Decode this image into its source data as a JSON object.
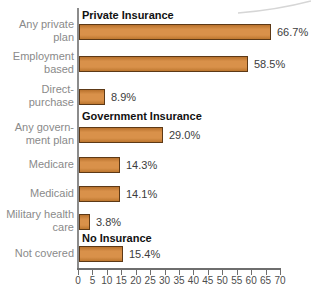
{
  "chart_data": {
    "type": "bar",
    "orientation": "horizontal",
    "title": "",
    "xlabel": "",
    "ylabel": "",
    "xlim": [
      0,
      70
    ],
    "x_ticks": [
      0,
      5,
      10,
      15,
      20,
      25,
      30,
      35,
      40,
      45,
      50,
      55,
      60,
      65,
      70
    ],
    "grid": false,
    "legend": false,
    "groups": [
      {
        "header": "Private Insurance",
        "items": [
          {
            "label": "Any private plan",
            "label_lines": [
              "Any private",
              "plan"
            ],
            "value": 66.7,
            "value_label": "66.7%"
          },
          {
            "label": "Employment based",
            "label_lines": [
              "Employment",
              "based"
            ],
            "value": 58.5,
            "value_label": "58.5%"
          },
          {
            "label": "Direct-purchase",
            "label_lines": [
              "Direct-",
              "purchase"
            ],
            "value": 8.9,
            "value_label": "8.9%"
          }
        ]
      },
      {
        "header": "Government Insurance",
        "items": [
          {
            "label": "Any government plan",
            "label_lines": [
              "Any govern-",
              "ment plan"
            ],
            "value": 29.0,
            "value_label": "29.0%"
          },
          {
            "label": "Medicare",
            "label_lines": [
              "Medicare"
            ],
            "value": 14.3,
            "value_label": "14.3%"
          },
          {
            "label": "Medicaid",
            "label_lines": [
              "Medicaid"
            ],
            "value": 14.1,
            "value_label": "14.1%"
          },
          {
            "label": "Military health care",
            "label_lines": [
              "Military health",
              "care"
            ],
            "value": 3.8,
            "value_label": "3.8%"
          }
        ]
      },
      {
        "header": "No Insurance",
        "items": [
          {
            "label": "Not covered",
            "label_lines": [
              "Not covered"
            ],
            "value": 15.4,
            "value_label": "15.4%"
          }
        ]
      }
    ],
    "colors": {
      "bar_fill": "#d28a45",
      "bar_border": "#5d3916",
      "axis": "#6e6e6e",
      "category_label": "#8a8a8a",
      "value_label": "#3c3c3c",
      "header_text": "#111111",
      "tick_label": "#4d4d4d",
      "background": "#ffffff",
      "page_curl": "#d6d6d6"
    }
  }
}
